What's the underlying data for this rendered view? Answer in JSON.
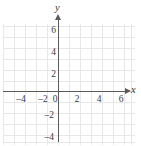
{
  "figure": {
    "kind": "cartesian-coordinate-plane",
    "background_color": "#ffffff",
    "grid_color": "#e8e8e8",
    "axis_color": "#5a5a5a",
    "label_color": "#3a3a3a"
  },
  "axes": {
    "x_name": "x",
    "y_name": "y",
    "origin_label": "0"
  },
  "chart_data": {
    "type": "scatter",
    "title": "",
    "subtitle": "",
    "xlabel": "x",
    "ylabel": "y",
    "xlim": [
      -5,
      7
    ],
    "ylim": [
      -5,
      7
    ],
    "xticks": [
      -4,
      -2,
      0,
      2,
      4,
      6
    ],
    "yticks": [
      6,
      4,
      2,
      0,
      -2,
      -4
    ],
    "xtick_labels": [
      "–4",
      "–2",
      "0",
      "2",
      "4",
      "6"
    ],
    "ytick_labels": [
      "6",
      "4",
      "2",
      "0",
      "–2",
      "–4"
    ],
    "grid": true,
    "grid_spacing": 1,
    "legend": null,
    "annotations": [],
    "series": [
      {
        "name": "",
        "x": [],
        "y": []
      }
    ],
    "note": "Empty coordinate grid with no plotted data points or curves."
  },
  "grid": {
    "vertical_lines_px": [
      3,
      14,
      25,
      36,
      47,
      58,
      69,
      80,
      91,
      102,
      113,
      124,
      131
    ],
    "horizontal_lines_px": [
      2,
      13,
      24,
      35,
      46,
      57,
      67,
      78,
      89,
      100,
      111,
      118
    ],
    "area": {
      "left": 3,
      "top": 24,
      "width": 132,
      "height": 121
    }
  },
  "ticks": {
    "x": [
      {
        "label": "–4",
        "left": 13,
        "top": 94
      },
      {
        "label": "–2",
        "left": 35,
        "top": 94
      },
      {
        "label": "0",
        "left": 47,
        "top": 94
      },
      {
        "label": "2",
        "left": 69,
        "top": 94
      },
      {
        "label": "4",
        "left": 91,
        "top": 94
      },
      {
        "label": "6",
        "left": 113,
        "top": 94
      }
    ],
    "y": [
      {
        "label": "6",
        "left": 40,
        "top": 25
      },
      {
        "label": "4",
        "left": 40,
        "top": 47
      },
      {
        "label": "2",
        "left": 40,
        "top": 69
      },
      {
        "label": "–2",
        "left": 38,
        "top": 110
      },
      {
        "label": "–4",
        "left": 38,
        "top": 132
      }
    ]
  }
}
